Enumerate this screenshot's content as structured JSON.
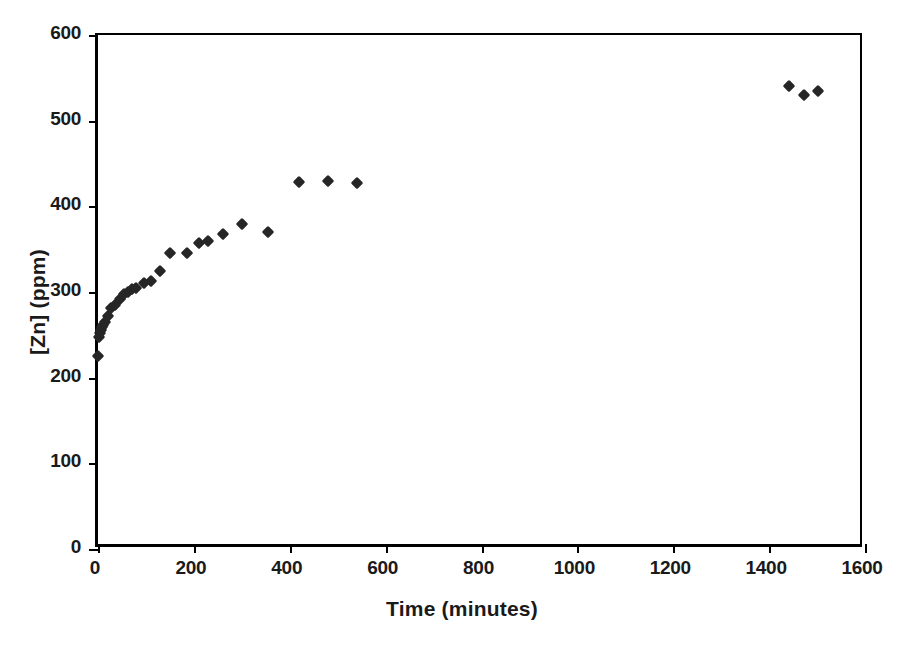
{
  "chart_data": {
    "type": "scatter",
    "title": "",
    "xlabel": "Time (minutes)",
    "ylabel": "[Zn] (ppm)",
    "xlim": [
      0,
      1600
    ],
    "ylim": [
      0,
      600
    ],
    "xticks": [
      0,
      200,
      400,
      600,
      800,
      1000,
      1200,
      1400,
      1600
    ],
    "yticks": [
      0,
      100,
      200,
      300,
      400,
      500,
      600
    ],
    "grid": false,
    "legend": false,
    "marker": "diamond",
    "marker_color": "#262626",
    "series": [
      {
        "name": "[Zn]",
        "points": [
          [
            0,
            225
          ],
          [
            3,
            248
          ],
          [
            5,
            252
          ],
          [
            7,
            256
          ],
          [
            9,
            259
          ],
          [
            11,
            262
          ],
          [
            14,
            265
          ],
          [
            20,
            272
          ],
          [
            28,
            281
          ],
          [
            35,
            285
          ],
          [
            45,
            292
          ],
          [
            55,
            298
          ],
          [
            62,
            300
          ],
          [
            70,
            303
          ],
          [
            80,
            305
          ],
          [
            95,
            310
          ],
          [
            110,
            313
          ],
          [
            130,
            324
          ],
          [
            150,
            345
          ],
          [
            185,
            345
          ],
          [
            210,
            357
          ],
          [
            230,
            360
          ],
          [
            260,
            368
          ],
          [
            300,
            379
          ],
          [
            355,
            370
          ],
          [
            420,
            428
          ],
          [
            480,
            429
          ],
          [
            540,
            427
          ],
          [
            1442,
            540
          ],
          [
            1472,
            530
          ],
          [
            1502,
            535
          ]
        ]
      }
    ]
  },
  "axes": {
    "x_tick_labels": [
      "0",
      "200",
      "400",
      "600",
      "800",
      "1000",
      "1200",
      "1400",
      "1600"
    ],
    "y_tick_labels": [
      "0",
      "100",
      "200",
      "300",
      "400",
      "500",
      "600"
    ]
  }
}
